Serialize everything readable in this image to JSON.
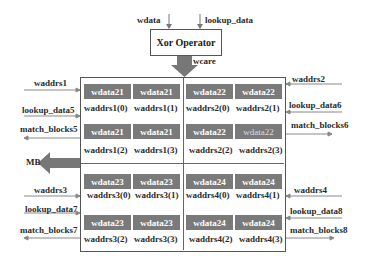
{
  "xor": {
    "label": "Xor Operator",
    "input_left": "wdata",
    "input_right": "lookup_data",
    "output": "wcare"
  },
  "output_arrow": "MB",
  "quadrants": [
    {
      "name": "q1",
      "cells": [
        "wdata21",
        "wdata21",
        "wdata21",
        "wdata21"
      ],
      "addrs": [
        "waddrs1(0)",
        "waddrs1(1)",
        "waddrs1(2)",
        "waddrs1(3)"
      ],
      "side": {
        "waddrs": "waddrs1",
        "lookup": "lookup_data5",
        "match": "match_blocks5"
      }
    },
    {
      "name": "q2",
      "cells": [
        "wdata22",
        "wdata22",
        "wdata22",
        "wdata22"
      ],
      "addrs": [
        "waddrs2(0)",
        "waddrs2(1)",
        "waddrs2(2)",
        "waddrs2(3)"
      ],
      "side": {
        "waddrs": "waddrs2",
        "lookup": "lookup_data6",
        "match": "match_blocks6"
      }
    },
    {
      "name": "q3",
      "cells": [
        "wdata23",
        "wdata23",
        "wdata23",
        "wdata23"
      ],
      "addrs": [
        "waddrs3(0)",
        "waddrs3(1)",
        "waddrs3(2)",
        "waddrs3(3)"
      ],
      "side": {
        "waddrs": "waddrs3",
        "lookup": "lookup_data7",
        "match": "match_blocks7"
      }
    },
    {
      "name": "q4",
      "cells": [
        "wdata24",
        "wdata24",
        "wdata24",
        "wdata24"
      ],
      "addrs": [
        "waddrs4(0)",
        "waddrs4(1)",
        "waddrs4(2)",
        "waddrs4(3)"
      ],
      "side": {
        "waddrs": "waddrs4",
        "lookup": "lookup_data8",
        "match": "match_blocks8"
      }
    }
  ],
  "colors": {
    "cell_fill": "#7a7a7a",
    "arrow_fill": "#777777",
    "line": "#666666"
  }
}
